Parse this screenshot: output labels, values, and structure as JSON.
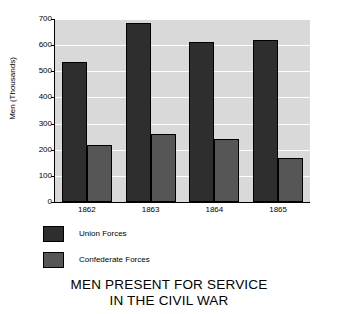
{
  "chart_data": {
    "type": "bar",
    "title": "MEN PRESENT FOR SERVICE IN THE CIVIL WAR",
    "title_line1": "MEN PRESENT FOR SERVICE",
    "title_line2": "IN THE CIVIL WAR",
    "xlabel": "",
    "ylabel": "Men (Thousands)",
    "categories": [
      "1862",
      "1863",
      "1864",
      "1865"
    ],
    "series": [
      {
        "name": "Union Forces",
        "color": "#2e2e2e",
        "values": [
          535,
          685,
          611,
          620
        ]
      },
      {
        "name": "Confederate Forces",
        "color": "#565656",
        "values": [
          218,
          261,
          240,
          170
        ]
      }
    ],
    "ylim": [
      0,
      700
    ],
    "ytick_labels": [
      "700",
      "600",
      "500",
      "400",
      "300",
      "200",
      "100",
      "0"
    ],
    "ytick_values": [
      700,
      600,
      500,
      400,
      300,
      200,
      100,
      0
    ],
    "grid": "horizontal",
    "legend_position": "below-plot-left",
    "plot_background": "#d9d9d9",
    "gridline_color": "#ffffff"
  },
  "legend": {
    "items": [
      {
        "label": "Union Forces",
        "swatch_name": "legend-swatch-union"
      },
      {
        "label": "Confederate Forces",
        "swatch_name": "legend-swatch-confederate"
      }
    ]
  },
  "axis": {
    "y_title": "Men (Thousands)"
  }
}
